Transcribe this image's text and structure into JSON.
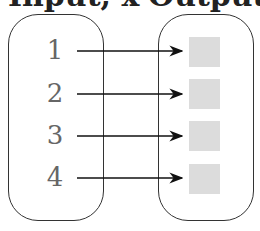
{
  "headers": {
    "input": "Input, x",
    "output": "Output, y"
  },
  "inputs": [
    "1",
    "2",
    "3",
    "4"
  ],
  "outputs": [
    "",
    "",
    "",
    ""
  ],
  "colors": {
    "stroke": "#333333",
    "square": "#dcdcdc",
    "number": "#666666"
  }
}
